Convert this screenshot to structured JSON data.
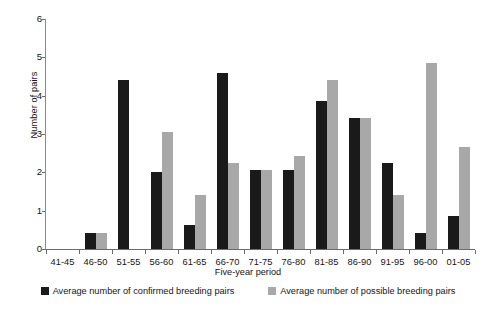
{
  "chart_data": {
    "type": "bar",
    "title": "",
    "subtitle": "",
    "xlabel": "Five-year period",
    "ylabel": "Number of pairs",
    "ylim": [
      0,
      6
    ],
    "yticks": [
      0,
      1,
      2,
      3,
      4,
      5,
      6
    ],
    "ytick_labels": [
      "0",
      "1",
      "2",
      "3",
      "4",
      "5",
      "6"
    ],
    "grid": false,
    "legend_position": "bottom",
    "categories": [
      "41-45",
      "46-50",
      "51-55",
      "56-60",
      "61-65",
      "66-70",
      "71-75",
      "76-80",
      "81-85",
      "86-90",
      "91-95",
      "96-00",
      "01-05"
    ],
    "series": [
      {
        "name": "Average number of confirmed breeding pairs",
        "color": "#1a1a1a",
        "values": [
          0,
          0.42,
          4.4,
          2.02,
          0.62,
          4.6,
          2.05,
          2.05,
          3.85,
          3.42,
          2.25,
          0.42,
          0.85
        ]
      },
      {
        "name": "Average number of possible breeding pairs",
        "color": "#a8a8a8",
        "values": [
          0,
          0.42,
          0,
          3.05,
          1.42,
          2.25,
          2.05,
          2.42,
          4.42,
          3.42,
          1.42,
          4.85,
          2.65
        ]
      }
    ]
  },
  "axes": {
    "y_title": "Number of pairs",
    "x_title": "Five-year period"
  },
  "legend": {
    "items": [
      {
        "label": "Average number of confirmed breeding pairs",
        "color": "#1a1a1a"
      },
      {
        "label": "Average number of possible breeding pairs",
        "color": "#a8a8a8"
      }
    ]
  }
}
